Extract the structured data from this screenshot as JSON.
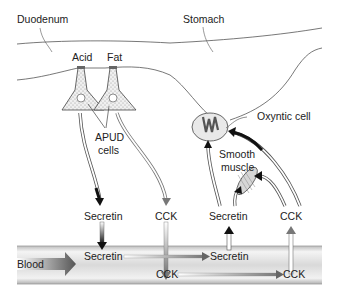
{
  "labels": {
    "duodenum": "Duodenum",
    "stomach": "Stomach",
    "acid": "Acid",
    "fat": "Fat",
    "apud_line1": "APUD",
    "apud_line2": "cells",
    "oxyntic_cell": "Oxyntic cell",
    "smooth_muscle_line1": "Smooth",
    "smooth_muscle_line2": "muscle",
    "secretin_release": "Secretin",
    "cck_release": "CCK",
    "secretin_blood": "Secretin",
    "secretin_blood_target": "Secretin",
    "cck_blood": "CCK",
    "cck_blood_target": "CCK",
    "secretin_target": "Secretin",
    "cck_target": "CCK",
    "blood": "Blood"
  },
  "colors": {
    "line": "#555555",
    "arrow_dark": "#111111",
    "arrow_gray": "#8a8a8a",
    "blood_vessel": "#e6e6e6",
    "cell_fill": "#e9e9e9"
  }
}
